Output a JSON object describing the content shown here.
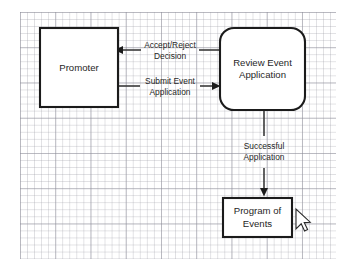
{
  "canvas": {
    "width": 349,
    "height": 273,
    "background_color": "#ffffff",
    "grid": {
      "name": "graph-paper-grid",
      "minor_spacing_px": 7,
      "major_spacing_px": 35,
      "minor_color": "#969aa0",
      "major_color": "#787885"
    }
  },
  "diagram": {
    "type": "flow-diagram",
    "stroke_color": "#1b1b1b",
    "text_color": "#1f1f1f",
    "nodes": [
      {
        "id": "promoter",
        "label": "Promoter",
        "shape": "rectangle",
        "x": 40,
        "y": 28,
        "width": 78,
        "height": 79
      },
      {
        "id": "review-event-application",
        "label_line1": "Review Event",
        "label_line2": "Application",
        "shape": "rounded-rectangle",
        "corner_radius": 14,
        "x": 220,
        "y": 28,
        "width": 85,
        "height": 82
      },
      {
        "id": "program-of-events",
        "label_line1": "Program of",
        "label_line2": "Events",
        "shape": "rectangle",
        "x": 223,
        "y": 198,
        "width": 69,
        "height": 39
      }
    ],
    "edges": [
      {
        "id": "accept-reject-decision",
        "from": "review-event-application",
        "to": "promoter",
        "direction": "left",
        "label_line1": "Accept/Reject",
        "label_line2": "Decision"
      },
      {
        "id": "submit-event-application",
        "from": "promoter",
        "to": "review-event-application",
        "direction": "right",
        "label_line1": "Submit Event",
        "label_line2": "Application"
      },
      {
        "id": "successful-application",
        "from": "review-event-application",
        "to": "program-of-events",
        "direction": "down",
        "label_line1": "Successful",
        "label_line2": "Application"
      }
    ]
  },
  "pointer": {
    "name": "mouse-cursor",
    "kind": "arrow",
    "x": 296,
    "y": 210
  }
}
